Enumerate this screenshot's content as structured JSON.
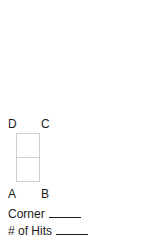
{
  "diagram": {
    "corners": {
      "top_left": "D",
      "top_right": "C",
      "bottom_left": "A",
      "bottom_right": "B"
    },
    "rectangle": {
      "cells": 2,
      "orientation": "vertical",
      "stroke_color": "#cfcfcf"
    }
  },
  "fields": [
    {
      "label": "Corner",
      "value": ""
    },
    {
      "label": "# of Hits",
      "value": ""
    }
  ]
}
